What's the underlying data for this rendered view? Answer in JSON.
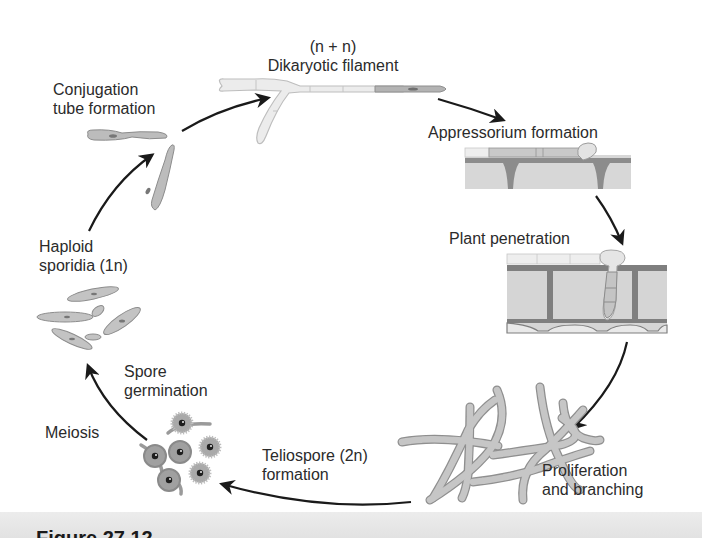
{
  "diagram": {
    "type": "life-cycle",
    "colors": {
      "background": "#ffffff",
      "arrow": "#1a1a1a",
      "cell_fill": "#b9b9b9",
      "cell_outline": "#8a8a8a",
      "light_hypha": "#eeeeee",
      "plant_wall": "#8c8c8c",
      "plant_cell": "#d4d4d4",
      "caption_strip": "#e6e6e6"
    },
    "stages": [
      {
        "id": "dikaryotic",
        "line1": "(n + n)",
        "line2": "Dikaryotic filament"
      },
      {
        "id": "appressorium",
        "line1": "Appressorium formation"
      },
      {
        "id": "penetration",
        "line1": "Plant penetration"
      },
      {
        "id": "proliferation",
        "line1": "Proliferation",
        "line2": "and branching"
      },
      {
        "id": "teliospore",
        "line1": "Teliospore (2n)",
        "line2": "formation"
      },
      {
        "id": "meiosis",
        "line1": "Meiosis"
      },
      {
        "id": "germination",
        "line1": "Spore",
        "line2": "germination"
      },
      {
        "id": "sporidia",
        "line1": "Haploid",
        "line2": "sporidia (1n)"
      },
      {
        "id": "conjugation",
        "line1": "Conjugation",
        "line2": "tube formation"
      }
    ],
    "cycle_order": [
      "conjugation",
      "dikaryotic",
      "appressorium",
      "penetration",
      "proliferation",
      "teliospore",
      "meiosis",
      "germination",
      "sporidia"
    ],
    "caption_partial": "Figure 27.12"
  }
}
